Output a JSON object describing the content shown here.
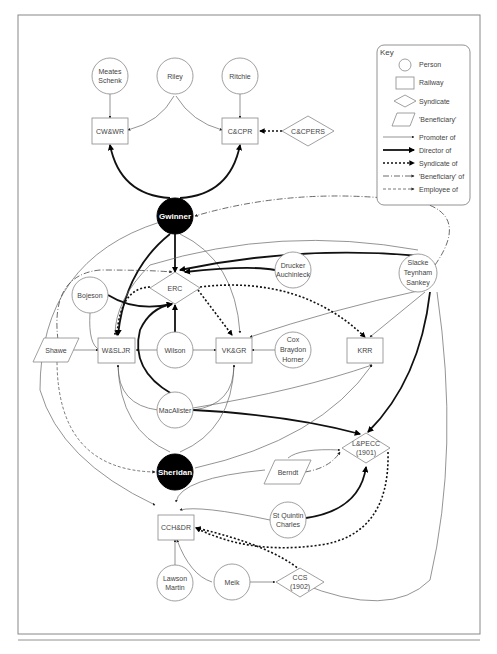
{
  "figure": {
    "key": {
      "title": "Key",
      "shapes": [
        {
          "shape": "circle",
          "label": "Person"
        },
        {
          "shape": "rectangle",
          "label": "Railway"
        },
        {
          "shape": "diamond",
          "label": "Syndicate"
        },
        {
          "shape": "parallelogram",
          "label": "'Beneficiary'"
        }
      ],
      "edges": [
        {
          "style": "thin-solid",
          "label": "Promoter of"
        },
        {
          "style": "thick-solid",
          "label": "Director of"
        },
        {
          "style": "thick-dotted",
          "label": "Syndicate of"
        },
        {
          "style": "dash-dot",
          "label": "'Beneficiary' of"
        },
        {
          "style": "dashed",
          "label": "Employee of"
        }
      ]
    },
    "nodes": {
      "meates_schenk": {
        "type": "person",
        "line1": "Meates",
        "line2": "Schenk"
      },
      "riley": {
        "type": "person",
        "label": "Riley"
      },
      "ritchie": {
        "type": "person",
        "label": "Ritchie"
      },
      "cwwr": {
        "type": "railway",
        "label": "CW&WR"
      },
      "ccpr": {
        "type": "railway",
        "label": "C&CPR"
      },
      "ccpers": {
        "type": "syndicate",
        "label": "C&CPERS"
      },
      "gwinner": {
        "type": "person-highlight",
        "label": "Gwinner"
      },
      "erc": {
        "type": "syndicate",
        "label": "ERC"
      },
      "drucker": {
        "type": "person",
        "line1": "Drucker",
        "line2": "Auchinleck"
      },
      "slacke": {
        "type": "person",
        "line1": "Slacke",
        "line2": "Teynham",
        "line3": "Sankey"
      },
      "bojeson": {
        "type": "person",
        "label": "Bojeson"
      },
      "shawe": {
        "type": "beneficiary",
        "label": "Shawe"
      },
      "wsljr": {
        "type": "railway",
        "label": "W&SLJR"
      },
      "wilson": {
        "type": "person",
        "label": "Wilson"
      },
      "vkgr": {
        "type": "railway",
        "label": "VK&GR"
      },
      "cox": {
        "type": "person",
        "line1": "Cox",
        "line2": "Braydon",
        "line3": "Horner"
      },
      "krr": {
        "type": "railway",
        "label": "KRR"
      },
      "macalister": {
        "type": "person",
        "label": "MacAlister"
      },
      "lpecc": {
        "type": "syndicate",
        "line1": "L&PECC",
        "line2": "(1901)"
      },
      "berndt": {
        "type": "beneficiary",
        "label": "Berndt"
      },
      "sheridan": {
        "type": "person-highlight",
        "label": "Sheridan"
      },
      "stquintin": {
        "type": "person",
        "line1": "St Quintin",
        "line2": "Charles"
      },
      "cchdr": {
        "type": "railway",
        "label": "CCH&DR"
      },
      "lawson": {
        "type": "person",
        "line1": "Lawson",
        "line2": "Martin"
      },
      "meik": {
        "type": "person",
        "label": "Meik"
      },
      "ccs": {
        "type": "syndicate",
        "line1": "CCS",
        "line2": "(1902)"
      }
    },
    "edges": [
      {
        "from": "Meates Schenk",
        "to": "CW&WR",
        "type": "Promoter of"
      },
      {
        "from": "Riley",
        "to": "CW&WR",
        "type": "Promoter of"
      },
      {
        "from": "Riley",
        "to": "C&CPR",
        "type": "Promoter of"
      },
      {
        "from": "Ritchie",
        "to": "C&CPR",
        "type": "Promoter of"
      },
      {
        "from": "C&CPERS",
        "to": "C&CPR",
        "type": "Syndicate of"
      },
      {
        "from": "Gwinner",
        "to": "CW&WR",
        "type": "Director of"
      },
      {
        "from": "Gwinner",
        "to": "C&CPR",
        "type": "Director of"
      },
      {
        "from": "Gwinner",
        "to": "ERC",
        "type": "Director of"
      },
      {
        "from": "Gwinner",
        "to": "W&SLJR",
        "type": "Director of"
      },
      {
        "from": "Slacke Teynham Sankey",
        "to": "Gwinner",
        "type": "'Beneficiary' of"
      },
      {
        "from": "Slacke Teynham Sankey",
        "to": "ERC",
        "type": "Director of"
      },
      {
        "from": "Slacke Teynham Sankey",
        "to": "L&PECC (1901)",
        "type": "Director of"
      },
      {
        "from": "Drucker Auchinleck",
        "to": "ERC",
        "type": "Director of"
      },
      {
        "from": "Bojeson",
        "to": "ERC",
        "type": "Director of"
      },
      {
        "from": "Wilson",
        "to": "ERC",
        "type": "Director of"
      },
      {
        "from": "MacAlister",
        "to": "ERC",
        "type": "Director of"
      },
      {
        "from": "ERC",
        "to": "W&SLJR",
        "type": "Syndicate of"
      },
      {
        "from": "ERC",
        "to": "VK&GR",
        "type": "Syndicate of"
      },
      {
        "from": "ERC",
        "to": "KRR",
        "type": "Syndicate of"
      },
      {
        "from": "Shawe",
        "to": "ERC",
        "type": "'Beneficiary' of"
      },
      {
        "from": "Shawe",
        "to": "W&SLJR",
        "type": "Promoter of"
      },
      {
        "from": "Shawe",
        "to": "Sheridan",
        "type": "Employee of"
      },
      {
        "from": "Wilson",
        "to": "W&SLJR",
        "type": "Promoter of"
      },
      {
        "from": "Wilson",
        "to": "VK&GR",
        "type": "Promoter of"
      },
      {
        "from": "Cox Braydon Horner",
        "to": "VK&GR",
        "type": "Promoter of"
      },
      {
        "from": "MacAlister",
        "to": "W&SLJR",
        "type": "Promoter of"
      },
      {
        "from": "MacAlister",
        "to": "VK&GR",
        "type": "Promoter of"
      },
      {
        "from": "MacAlister",
        "to": "L&PECC (1901)",
        "type": "Director of"
      },
      {
        "from": "Sheridan",
        "to": "KRR",
        "type": "Promoter of"
      },
      {
        "from": "Berndt",
        "to": "L&PECC (1901)",
        "type": "'Beneficiary' of"
      },
      {
        "from": "St Quintin Charles",
        "to": "L&PECC (1901)",
        "type": "Director of"
      },
      {
        "from": "L&PECC (1901)",
        "to": "CCH&DR",
        "type": "Syndicate of"
      },
      {
        "from": "CCS (1902)",
        "to": "CCH&DR",
        "type": "Syndicate of"
      },
      {
        "from": "Lawson Martin",
        "to": "CCH&DR",
        "type": "Promoter of"
      },
      {
        "from": "Meik",
        "to": "CCH&DR",
        "type": "Promoter of"
      },
      {
        "from": "Meik",
        "to": "CCS (1902)",
        "type": "Promoter of"
      }
    ]
  }
}
